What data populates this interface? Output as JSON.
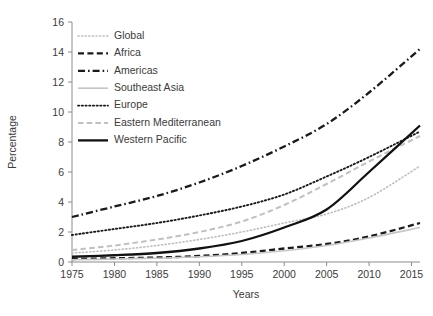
{
  "chart_data": {
    "type": "line",
    "title": "",
    "subtitle": "",
    "xlabel": "Years",
    "ylabel": "Percentage",
    "xlim": [
      1975,
      2016
    ],
    "ylim": [
      0,
      16
    ],
    "grid": false,
    "legend_position": "top-left-inside",
    "xticks": [
      "1975",
      "1980",
      "1985",
      "1990",
      "1995",
      "2000",
      "2005",
      "2010",
      "2015"
    ],
    "yticks": [
      "0",
      "2",
      "4",
      "6",
      "8",
      "10",
      "12",
      "14",
      "16"
    ],
    "x": [
      1975,
      1980,
      1985,
      1990,
      1995,
      2000,
      2005,
      2010,
      2016
    ],
    "series": [
      {
        "name": "Global",
        "style": "dotted-light",
        "color": "#b9b9b9",
        "values": [
          0.6,
          0.8,
          1.1,
          1.5,
          2.0,
          2.6,
          3.2,
          4.3,
          6.4
        ]
      },
      {
        "name": "Africa",
        "style": "dashed-dark",
        "color": "#1a1a1a",
        "values": [
          0.2,
          0.25,
          0.3,
          0.4,
          0.6,
          0.9,
          1.2,
          1.7,
          2.6
        ]
      },
      {
        "name": "Americas",
        "style": "dashdot-dark",
        "color": "#1a1a1a",
        "values": [
          3.0,
          3.7,
          4.4,
          5.3,
          6.4,
          7.7,
          9.2,
          11.3,
          14.2
        ]
      },
      {
        "name": "Southeast Asia",
        "style": "solid-light",
        "color": "#c2c2c2",
        "values": [
          0.15,
          0.2,
          0.25,
          0.35,
          0.5,
          0.75,
          1.1,
          1.6,
          2.3
        ]
      },
      {
        "name": "Europe",
        "style": "dotted-dark",
        "color": "#1a1a1a",
        "values": [
          1.8,
          2.2,
          2.6,
          3.1,
          3.7,
          4.5,
          5.7,
          7.0,
          8.7
        ]
      },
      {
        "name": "Eastern Mediterranean",
        "style": "dashed-light",
        "color": "#bdbdbd",
        "values": [
          0.8,
          1.1,
          1.5,
          2.0,
          2.7,
          3.8,
          5.2,
          6.7,
          8.4
        ]
      },
      {
        "name": "Western Pacific",
        "style": "solid-dark",
        "color": "#111111",
        "values": [
          0.35,
          0.45,
          0.6,
          0.9,
          1.4,
          2.3,
          3.5,
          6.0,
          9.1
        ]
      }
    ]
  },
  "legend": {
    "items": [
      {
        "label": "Global",
        "key": "Global"
      },
      {
        "label": "Africa",
        "key": "Africa"
      },
      {
        "label": "Americas",
        "key": "Americas"
      },
      {
        "label": "Southeast Asia",
        "key": "Southeast Asia"
      },
      {
        "label": "Europe",
        "key": "Europe"
      },
      {
        "label": "Eastern Mediterranean",
        "key": "Eastern Mediterranean"
      },
      {
        "label": "Western Pacific",
        "key": "Western Pacific"
      }
    ]
  },
  "colors": {
    "axis": "#8c8c8c",
    "text": "#3b3b3b",
    "dark_line": "#1a1a1a",
    "light_line": "#bdbdbd",
    "background": "#ffffff"
  }
}
